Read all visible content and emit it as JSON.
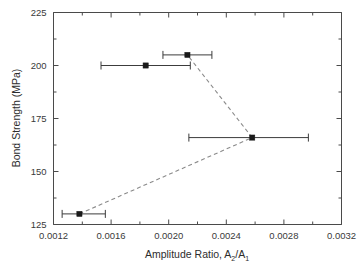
{
  "chart_data": {
    "type": "scatter",
    "title": "",
    "xlabel": "Amplitude Ratio, A₂/A₁",
    "ylabel": "Bond Strength (MPa)",
    "xlim": [
      0.0012,
      0.0032
    ],
    "ylim": [
      125,
      225
    ],
    "xticks": [
      0.0012,
      0.0016,
      0.002,
      0.0024,
      0.0028,
      0.0032
    ],
    "xtick_labels": [
      "0.0012",
      "0.0016",
      "0.0020",
      "0.0024",
      "0.0028",
      "0.0032"
    ],
    "yticks": [
      125,
      150,
      175,
      200,
      225
    ],
    "ytick_labels": [
      "125",
      "150",
      "175",
      "200",
      "225"
    ],
    "minor_ticks_per_interval": 1,
    "grid": false,
    "legend": false,
    "marker_style": "filled-square",
    "error_bars": "horizontal",
    "points": [
      {
        "x": 0.00138,
        "y": 130,
        "xerr_low": 0.00012,
        "xerr_high": 0.00018,
        "label": "point-1"
      },
      {
        "x": 0.00258,
        "y": 166,
        "xerr_low": 0.00044,
        "xerr_high": 0.00039,
        "label": "point-2"
      },
      {
        "x": 0.00213,
        "y": 205,
        "xerr_low": 0.00017,
        "xerr_high": 0.00017,
        "label": "point-3"
      },
      {
        "x": 0.00184,
        "y": 200,
        "xerr_low": 0.00031,
        "xerr_high": 0.00031,
        "label": "point-4"
      }
    ],
    "trend_path": [
      {
        "x": 0.00138,
        "y": 130
      },
      {
        "x": 0.00258,
        "y": 166
      },
      {
        "x": 0.00213,
        "y": 205
      }
    ],
    "trend_style": "dashed"
  },
  "axis": {
    "x_title_prefix": "Amplitude Ratio, A",
    "x_title_sub1": "2",
    "x_title_mid": "/A",
    "x_title_sub2": "1",
    "y_title": "Bond Strength (MPa)"
  },
  "colors": {
    "marker": "#1a1a1a",
    "trend": "#8a8a8a",
    "axis": "#4a4a4a",
    "background": "#ffffff",
    "text": "#2d2d2d"
  }
}
